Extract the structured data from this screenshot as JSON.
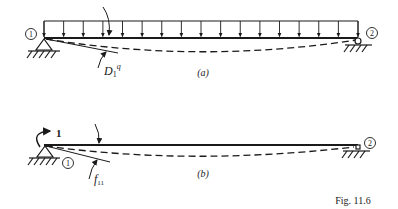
{
  "figure": {
    "caption": "Fig. 11.6",
    "colors": {
      "ink": "#1a1a1a",
      "background": "#ffffff"
    }
  },
  "panel_a": {
    "label": "(a)",
    "node_left": "1",
    "node_right": "2",
    "deflection_label_main": "D",
    "deflection_label_sub": "1",
    "deflection_label_sup": "q",
    "load": "uniform distributed load",
    "load_arrow_count": 17
  },
  "panel_b": {
    "label": "(b)",
    "node_left": "1",
    "node_right": "2",
    "moment_label": "1",
    "deflection_label_main": "f",
    "deflection_label_sub": "11"
  }
}
